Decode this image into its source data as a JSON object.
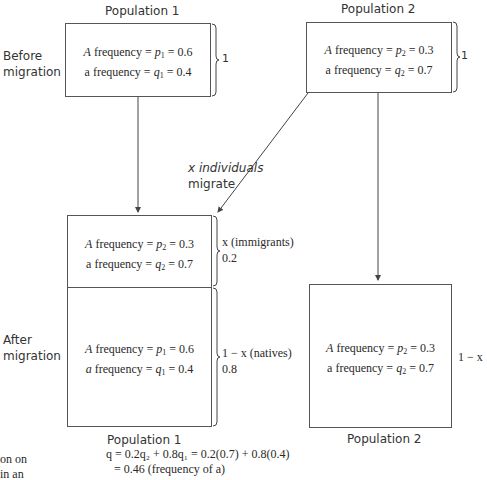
{
  "labels": {
    "before_migration_line1": "Before",
    "before_migration_line2": "migration",
    "after_migration_line1": "After",
    "after_migration_line2": "migration",
    "population1_top": "Population 1",
    "population2_top": "Population 2",
    "population1_bottom": "Population 1",
    "population2_bottom": "Population 2",
    "migrate_line1": "x individuals",
    "migrate_line2": "migrate"
  },
  "before": {
    "pop1": {
      "A_label": "A",
      "A_text": " frequency = ",
      "A_var": "p",
      "A_sub": "1",
      "A_value": " = 0.6",
      "a_label": "a",
      "a_text": " frequency = ",
      "a_var": "q",
      "a_sub": "1",
      "a_value": " = 0.4",
      "brace_label": "1"
    },
    "pop2": {
      "A_label": "A",
      "A_text": " frequency = ",
      "A_var": "p",
      "A_sub": "2",
      "A_value": " = 0.3",
      "a_label": "a",
      "a_text": " frequency = ",
      "a_var": "q",
      "a_sub": "2",
      "a_value": " = 0.7",
      "brace_label": "1"
    }
  },
  "after": {
    "pop1_immigrants": {
      "A_label": "A",
      "A_text": " frequency = ",
      "A_var": "p",
      "A_sub": "2",
      "A_value": " = 0.3",
      "a_label": "a",
      "a_text": " frequency = ",
      "a_var": "q",
      "a_sub": "2",
      "a_value": " = 0.7",
      "brace_label": "x (immigrants)",
      "brace_value": "0.2"
    },
    "pop1_natives": {
      "A_label": "A",
      "A_text": " frequency = ",
      "A_var": "p",
      "A_sub": "1",
      "A_value": " = 0.6",
      "a_label": "a",
      "a_text": " frequency = ",
      "a_var": "q",
      "a_sub": "1",
      "a_value": " = 0.4",
      "brace_label": "1 − x (natives)",
      "brace_value": "0.8"
    },
    "pop2": {
      "A_label": "A",
      "A_text": " frequency = ",
      "A_var": "p",
      "A_sub": "2",
      "A_value": " = 0.3",
      "a_label": "a",
      "a_text": " frequency = ",
      "a_var": "q",
      "a_sub": "2",
      "a_value": " = 0.7",
      "side_label": "1 − x"
    }
  },
  "equation": {
    "line1": "q = 0.2q₂ + 0.8q₁ = 0.2(0.7) + 0.8(0.4)",
    "line2": "= 0.46 (frequency of a)"
  },
  "caption_fragment": {
    "line1": "on on",
    "line2": "in an"
  }
}
